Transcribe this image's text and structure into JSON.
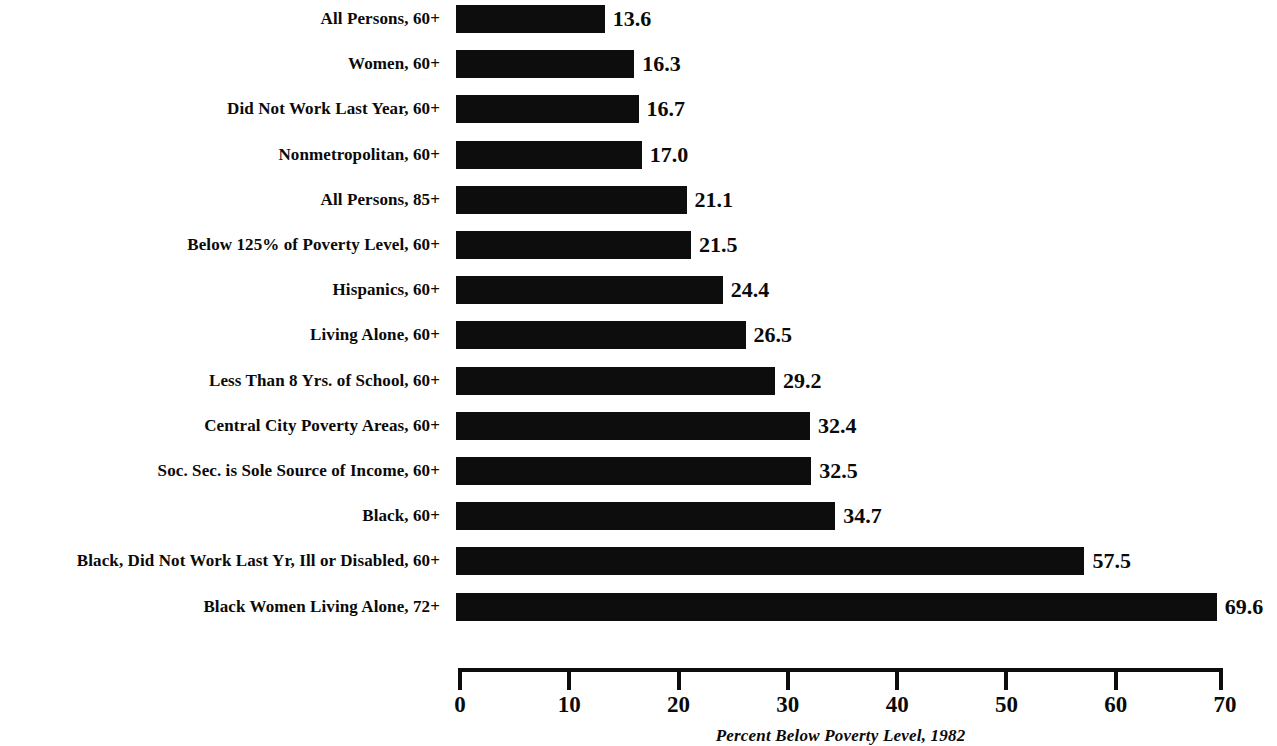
{
  "chart_data": {
    "type": "bar",
    "orientation": "horizontal",
    "title": "",
    "subtitle": "",
    "xlabel": "Percent Below Poverty Level, 1982",
    "ylabel": "",
    "xlim": [
      0,
      70
    ],
    "xticks": [
      0,
      10,
      20,
      30,
      40,
      50,
      60,
      70
    ],
    "xtick_labels": [
      "0",
      "10",
      "20",
      "30",
      "40",
      "50",
      "60",
      "70"
    ],
    "grid": false,
    "legend": null,
    "bar_color": "#0d0d0d",
    "background_color": "#ffffff",
    "categories": [
      "All Persons, 60+",
      "Women, 60+",
      "Did Not Work Last Year, 60+",
      "Nonmetropolitan, 60+",
      "All Persons, 85+",
      "Below 125% of Poverty Level, 60+",
      "Hispanics, 60+",
      "Living Alone, 60+",
      "Less Than 8 Yrs. of School, 60+",
      "Central City Poverty Areas, 60+",
      "Soc. Sec. is Sole Source of Income, 60+",
      "Black, 60+",
      "Black, Did Not Work Last Yr, Ill or Disabled, 60+",
      "Black Women Living Alone, 72+"
    ],
    "values": [
      13.6,
      16.3,
      16.7,
      17.0,
      21.1,
      21.5,
      24.4,
      26.5,
      29.2,
      32.4,
      32.5,
      34.7,
      57.5,
      69.6
    ],
    "value_labels": [
      "13.6",
      "16.3",
      "16.7",
      "17.0",
      "21.1",
      "21.5",
      "24.4",
      "26.5",
      "29.2",
      "32.4",
      "32.5",
      "34.7",
      "57.5",
      "69.6"
    ]
  },
  "axis": {
    "caption": "Percent Below Poverty Level, 1982"
  }
}
